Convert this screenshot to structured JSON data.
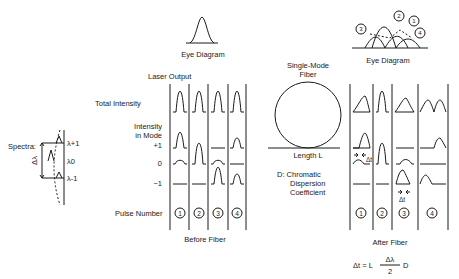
{
  "spectra": {
    "label": "Spectra:",
    "delta_label": "Δλ",
    "lines": [
      "λ+1",
      "λ0",
      "λ-1"
    ]
  },
  "before": {
    "eye_label": "Eye Diagram",
    "laser_output": "Laser Output",
    "total_intensity": "Total Intensity",
    "intensity_in_mode": "Intensity\nin Mode",
    "intensity_line1": "Intensity",
    "intensity_line2": "in Mode",
    "modes": [
      "+1",
      "0",
      "−1"
    ],
    "pulse_number": "Pulse Number",
    "pulses": [
      "1",
      "2",
      "3",
      "4"
    ],
    "caption": "Before Fiber"
  },
  "fiber": {
    "title_line1": "Single-Mode",
    "title_line2": "Fiber",
    "length": "Length L",
    "d_line1": "D:  Chromatic",
    "d_line2": "Dispersion",
    "d_line3": "Coefficient"
  },
  "after": {
    "eye_label": "Eye Diagram",
    "eye_markers": [
      "3",
      "2",
      "1",
      "4"
    ],
    "delta_t": "Δt",
    "pulses": [
      "1",
      "2",
      "3",
      "4"
    ],
    "caption": "After Fiber",
    "formula_lhs": "Δt = L",
    "formula_num": "Δλ",
    "formula_den": "2",
    "formula_rhs": "D"
  }
}
